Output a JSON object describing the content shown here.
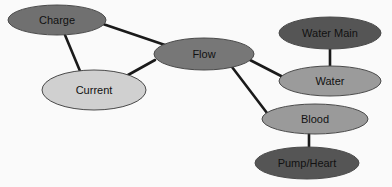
{
  "diagram": {
    "type": "concept-map",
    "nodes": [
      {
        "id": "charge",
        "label": "Charge",
        "cx": 57,
        "cy": 20,
        "rx": 49,
        "ry": 15,
        "fill": "#707070"
      },
      {
        "id": "current",
        "label": "Current",
        "cx": 94,
        "cy": 90,
        "rx": 52,
        "ry": 20,
        "fill": "#d0d0d0"
      },
      {
        "id": "flow",
        "label": "Flow",
        "cx": 204,
        "cy": 54,
        "rx": 50,
        "ry": 16,
        "fill": "#777777"
      },
      {
        "id": "water_main",
        "label": "Water Main",
        "cx": 330,
        "cy": 33,
        "rx": 51,
        "ry": 16,
        "fill": "#555555"
      },
      {
        "id": "water",
        "label": "Water",
        "cx": 330,
        "cy": 81,
        "rx": 51,
        "ry": 15,
        "fill": "#9b9b9b"
      },
      {
        "id": "blood",
        "label": "Blood",
        "cx": 315,
        "cy": 119,
        "rx": 53,
        "ry": 15,
        "fill": "#9a9a9a"
      },
      {
        "id": "pump_heart",
        "label": "Pump/Heart",
        "cx": 307,
        "cy": 163,
        "rx": 52,
        "ry": 16,
        "fill": "#555555"
      }
    ],
    "edges": [
      {
        "from": "charge",
        "to": "flow",
        "x1": 103,
        "y1": 24,
        "x2": 165,
        "y2": 45
      },
      {
        "from": "charge",
        "to": "current",
        "x1": 65,
        "y1": 35,
        "x2": 80,
        "y2": 71
      },
      {
        "from": "current",
        "to": "flow",
        "x1": 128,
        "y1": 75,
        "x2": 155,
        "y2": 60
      },
      {
        "from": "flow",
        "to": "water",
        "x1": 250,
        "y1": 60,
        "x2": 283,
        "y2": 77
      },
      {
        "from": "flow",
        "to": "blood",
        "x1": 232,
        "y1": 67,
        "x2": 267,
        "y2": 113
      },
      {
        "from": "water_main",
        "to": "water",
        "x1": 330,
        "y1": 49,
        "x2": 330,
        "y2": 66
      },
      {
        "from": "blood",
        "to": "pump_heart",
        "x1": 309,
        "y1": 134,
        "x2": 309,
        "y2": 147
      }
    ],
    "edge_color": "#1a1a1a",
    "edge_width": 2.6,
    "outline_color": "#4a4a4a"
  }
}
